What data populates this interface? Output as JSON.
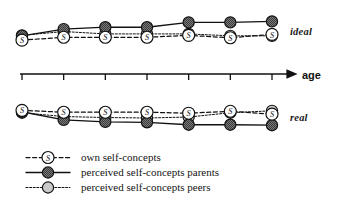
{
  "figure": {
    "axis_label": "age",
    "panels": [
      {
        "id": "ideal",
        "label": "ideal"
      },
      {
        "id": "real",
        "label": "real"
      }
    ]
  },
  "legend": {
    "items": [
      {
        "marker": "s-circle-marker",
        "line": "dashed",
        "label": "own self-concepts"
      },
      {
        "marker": "dark-circle-marker",
        "line": "solid",
        "label": "perceived self-concepts parents"
      },
      {
        "marker": "light-circle-marker",
        "line": "dotted",
        "label": "perceived self-concepts peers"
      }
    ]
  },
  "colors": {
    "ink": "#111111",
    "own_fill": "#ffffff",
    "parents_fill": "#6b6b6b",
    "peers_fill": "#c9c9c9"
  },
  "chart_data": {
    "type": "line",
    "title": "",
    "xlabel": "age",
    "ylabel": "",
    "grid": false,
    "legend_position": "bottom-left",
    "axis_ticks": 7,
    "x": [
      1,
      2,
      3,
      4,
      5,
      6,
      7
    ],
    "panels": [
      {
        "name": "ideal",
        "ylim": [
          0,
          10
        ],
        "series": [
          {
            "name": "own self-concepts",
            "values": [
              3.3,
              3.9,
              3.9,
              3.9,
              4.3,
              3.8,
              4.5
            ]
          },
          {
            "name": "perceived self-concepts parents",
            "values": [
              4.2,
              5.6,
              6.0,
              6.0,
              7.0,
              7.0,
              7.2
            ]
          },
          {
            "name": "perceived self-concepts peers",
            "values": [
              4.3,
              5.1,
              4.6,
              4.6,
              4.6,
              4.2,
              4.2
            ]
          }
        ]
      },
      {
        "name": "real",
        "ylim": [
          0,
          10
        ],
        "series": [
          {
            "name": "own self-concepts",
            "values": [
              6.6,
              6.2,
              6.2,
              6.2,
              6.0,
              6.4,
              5.8
            ]
          },
          {
            "name": "perceived self-concepts parents",
            "values": [
              6.3,
              4.6,
              4.2,
              4.1,
              3.6,
              3.6,
              3.5
            ]
          },
          {
            "name": "perceived self-concepts peers",
            "values": [
              6.1,
              5.3,
              5.1,
              5.0,
              5.2,
              6.1,
              6.5
            ]
          }
        ]
      }
    ]
  }
}
